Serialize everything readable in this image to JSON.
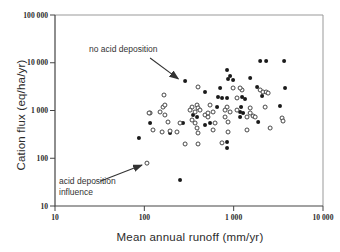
{
  "chart_data": {
    "type": "scatter",
    "title": "",
    "xlabel": "Mean annual runoff (mm/yr)",
    "ylabel": "Cation flux (eq/ha/yr)",
    "x_scale": "log",
    "y_scale": "log",
    "xlim": [
      10,
      10000
    ],
    "ylim": [
      10,
      100000
    ],
    "grid": false,
    "x_ticks": [
      {
        "value": 10,
        "label": "10"
      },
      {
        "value": 100,
        "label": "100"
      },
      {
        "value": 1000,
        "label": "1 000"
      },
      {
        "value": 10000,
        "label": "10 000"
      }
    ],
    "y_ticks": [
      {
        "value": 10,
        "label": "10"
      },
      {
        "value": 100,
        "label": "100"
      },
      {
        "value": 1000,
        "label": "1 000"
      },
      {
        "value": 10000,
        "label": "10 000"
      },
      {
        "value": 100000,
        "label": "100 000"
      }
    ],
    "annotations": [
      {
        "text": "no acid deposition",
        "arrow_from": [
          116,
          12600
        ],
        "arrow_to": [
          240,
          4600
        ]
      },
      {
        "text": "acid deposition influence",
        "arrow_from": [
          32,
          33
        ],
        "arrow_to": [
          94,
          72
        ]
      }
    ],
    "series": [
      {
        "name": "no acid deposition",
        "marker": "filled-circle",
        "color": "#1a1a1a",
        "points": [
          [
            286,
            4150
          ],
          [
            478,
            2440
          ],
          [
            843,
            7050
          ],
          [
            865,
            4570
          ],
          [
            985,
            4360
          ],
          [
            912,
            5270
          ],
          [
            705,
            2960
          ],
          [
            668,
            1920
          ],
          [
            741,
            1830
          ],
          [
            843,
            1830
          ],
          [
            1242,
            1920
          ],
          [
            652,
            1180
          ],
          [
            389,
            731
          ],
          [
            351,
            805
          ],
          [
            1274,
            887
          ],
          [
            271,
            547
          ],
          [
            478,
            497
          ],
          [
            544,
            547
          ],
          [
            194,
            338
          ],
          [
            87,
            266
          ],
          [
            116,
            547
          ],
          [
            843,
            219
          ],
          [
            843,
            164
          ],
          [
            251,
            35
          ],
          [
            1980,
            10900
          ],
          [
            2310,
            10900
          ],
          [
            3670,
            10900
          ],
          [
            1530,
            4800
          ],
          [
            1830,
            3100
          ],
          [
            2080,
            2010
          ],
          [
            3760,
            2960
          ],
          [
            1340,
            1740
          ],
          [
            1210,
            1180
          ],
          [
            3300,
            1240
          ],
          [
            1180,
            931
          ],
          [
            1180,
            731
          ],
          [
            1880,
            574
          ]
        ]
      },
      {
        "name": "acid deposition influence",
        "marker": "open-circle",
        "color": "#333333",
        "points": [
          [
            166,
            2110
          ],
          [
            162,
            1180
          ],
          [
            150,
            931
          ],
          [
            116,
            887
          ],
          [
            399,
            3110
          ],
          [
            985,
            2960
          ],
          [
            1240,
            2690
          ],
          [
            1090,
            1830
          ],
          [
            342,
            1180
          ],
          [
            389,
            1300
          ],
          [
            399,
            1130
          ],
          [
            544,
            1300
          ],
          [
            843,
            1180
          ],
          [
            478,
            805
          ],
          [
            516,
            731
          ],
          [
            801,
            731
          ],
          [
            170,
            1300
          ],
          [
            170,
            805
          ],
          [
            113,
            887
          ],
          [
            125,
            391
          ],
          [
            158,
            355
          ],
          [
            194,
            372
          ],
          [
            107,
            79
          ],
          [
            325,
            1020
          ],
          [
            370,
            931
          ],
          [
            420,
            1020
          ],
          [
            516,
            887
          ],
          [
            588,
            931
          ],
          [
            801,
            1020
          ],
          [
            912,
            931
          ],
          [
            1090,
            1020
          ],
          [
            184,
            574
          ],
          [
            251,
            547
          ],
          [
            342,
            632
          ],
          [
            370,
            547
          ],
          [
            619,
            547
          ],
          [
            865,
            574
          ],
          [
            232,
            355
          ],
          [
            389,
            430
          ],
          [
            399,
            338
          ],
          [
            588,
            391
          ],
          [
            865,
            355
          ],
          [
            286,
            199
          ],
          [
            399,
            199
          ],
          [
            1980,
            2690
          ],
          [
            2130,
            2440
          ],
          [
            2310,
            2440
          ],
          [
            2430,
            2320
          ],
          [
            1180,
            2960
          ],
          [
            1530,
            1130
          ],
          [
            2250,
            1180
          ],
          [
            1410,
            731
          ],
          [
            1650,
            767
          ],
          [
            3480,
            696
          ],
          [
            1530,
            887
          ],
          [
            1740,
            731
          ],
          [
            3570,
            602
          ],
          [
            1410,
            391
          ],
          [
            2560,
            430
          ],
          [
            740,
            210
          ]
        ]
      }
    ]
  },
  "colors": {
    "axis": "#444444",
    "box": "#999999",
    "tick_text": "#2b2b2b",
    "filled_point": "#1a1a1a",
    "open_point_stroke": "#333333",
    "arrow": "#333333"
  }
}
